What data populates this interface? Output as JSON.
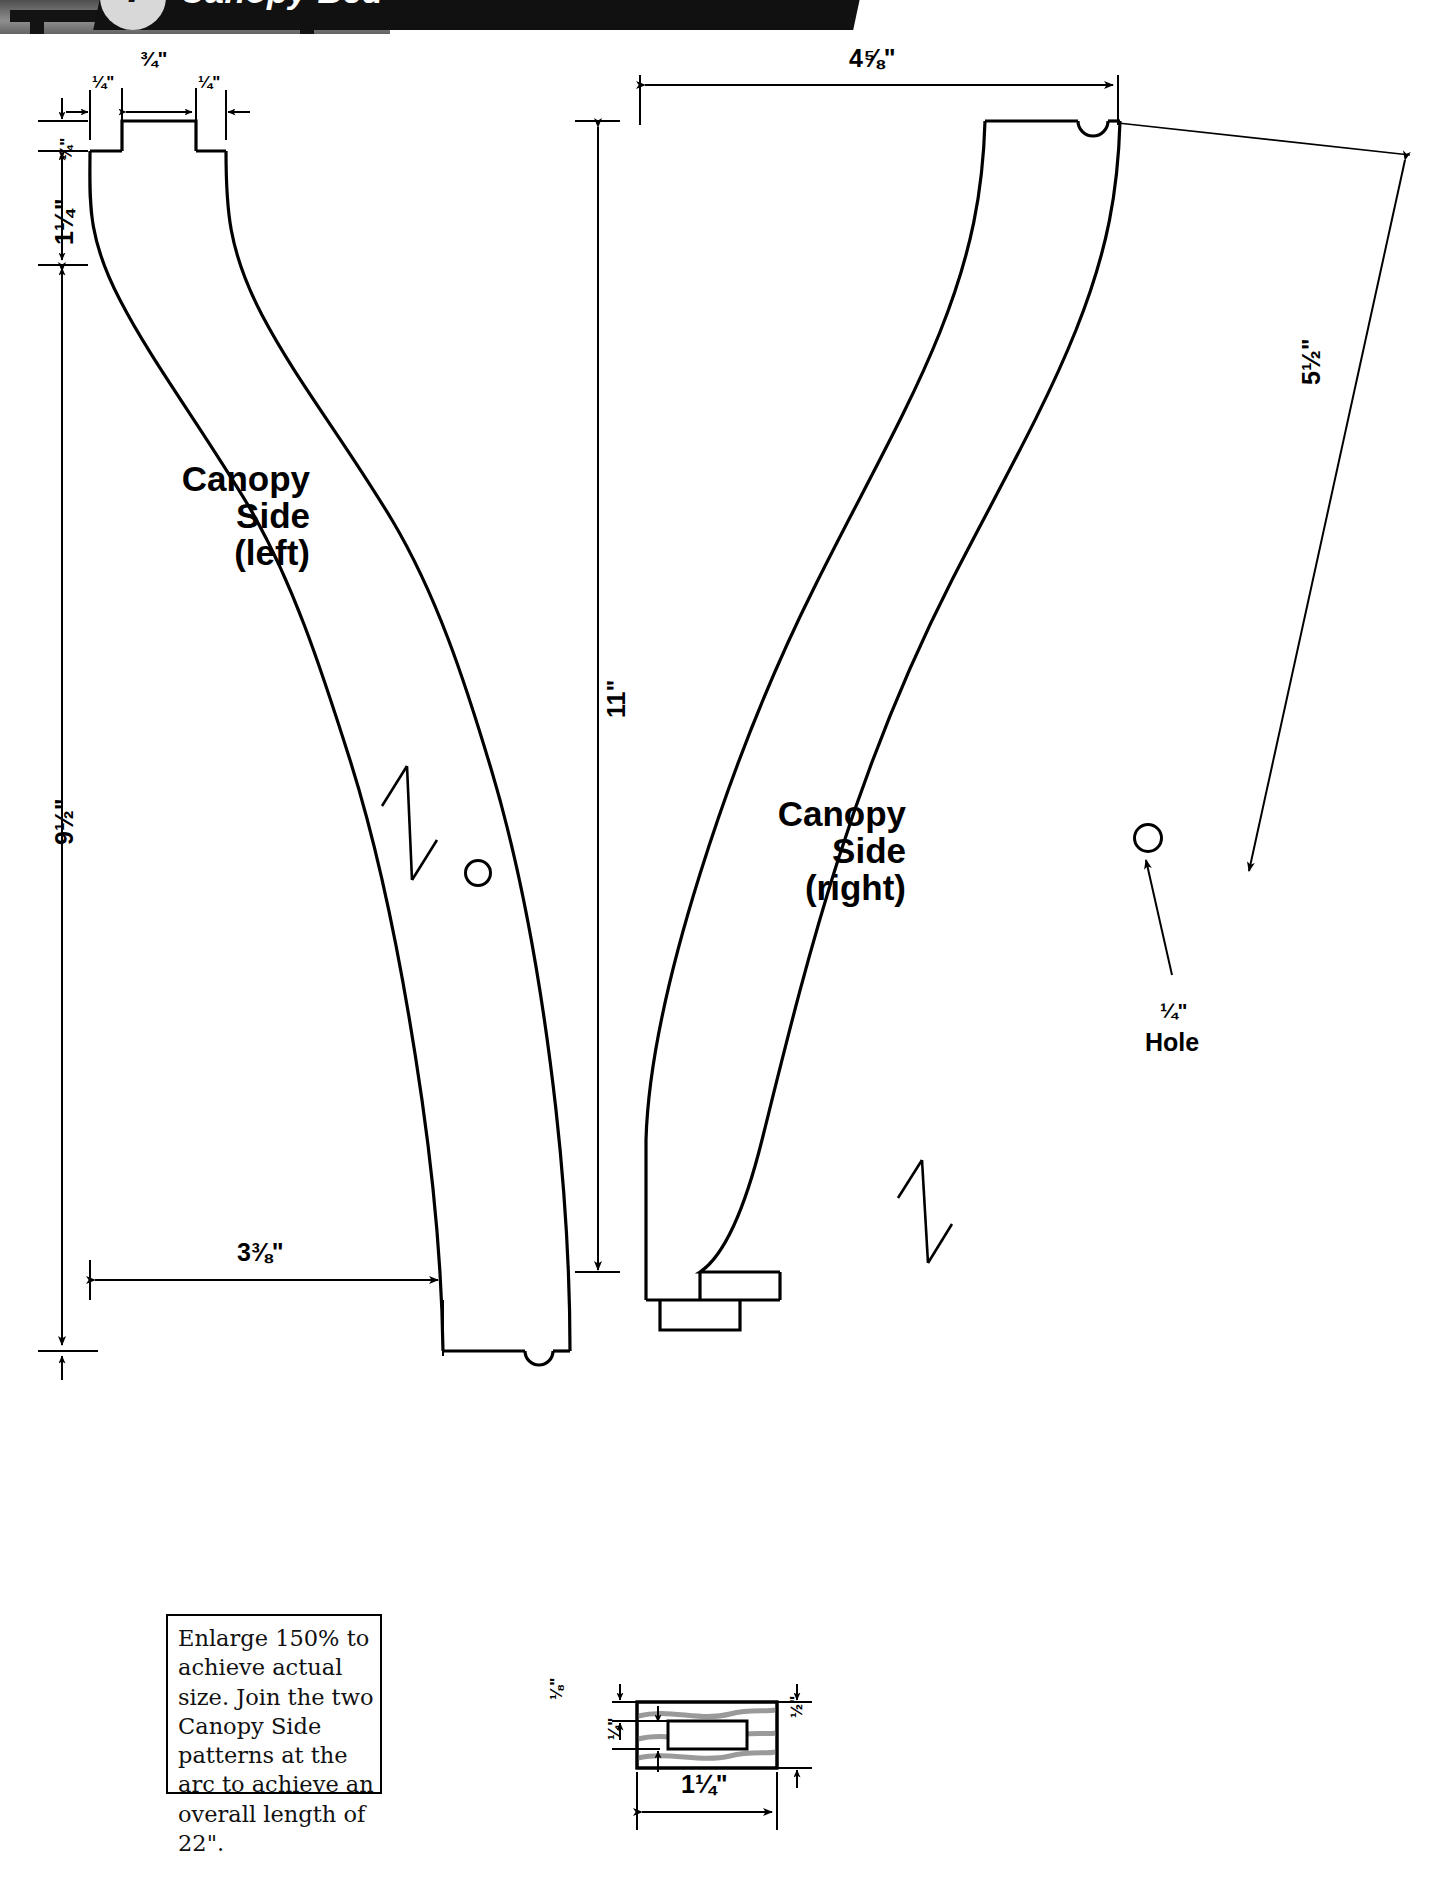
{
  "header": {
    "number": "7",
    "title": "Canopy Bed",
    "photo_alt": "canopy-bed-photo"
  },
  "parts": {
    "left": {
      "line1": "Canopy",
      "line2": "Side",
      "line3": "(left)"
    },
    "right": {
      "line1": "Canopy",
      "line2": "Side",
      "line3": "(right)"
    }
  },
  "dimensions": {
    "top_left_tenon_shoulder_left": "¼\"",
    "top_left_tenon_width": "¾\"",
    "top_left_tenon_shoulder_right": "¼\"",
    "top_left_tenon_height": "¼\"",
    "top_left_head_height": "1¼\"",
    "left_overall_height": "9½\"",
    "left_bottom_width": "3⅜\"",
    "middle_height": "11\"",
    "right_top_width": "4⅝\"",
    "right_diagonal": "5½\"",
    "hole_size": "¼\"",
    "hole_label": "Hole",
    "section_thickness_top": "⅛\"",
    "section_groove": "¼\"",
    "section_height_right": "½\"",
    "section_width": "1¼\""
  },
  "instruction_box": {
    "text": "Enlarge 150% to achieve actual size. Join the two Canopy Side patterns at the arc to achieve an overall length of 22\"."
  },
  "colors": {
    "line": "#000000",
    "grain": "#9a9a9a",
    "paper": "#ffffff",
    "banner": "#111111"
  },
  "icons": {
    "grain_arrow": "grain-direction-arrow",
    "hole": "hole-circle",
    "leader": "leader-arrow"
  }
}
